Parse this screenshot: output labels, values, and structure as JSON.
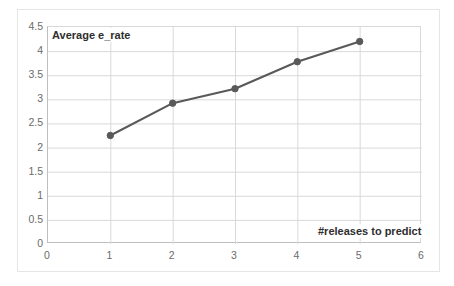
{
  "chart_data": {
    "type": "line",
    "title": "",
    "xlabel": "#releases to predict",
    "ylabel": "Average e_rate",
    "x": [
      1,
      2,
      3,
      4,
      5
    ],
    "values": [
      2.25,
      2.92,
      3.22,
      3.78,
      4.2
    ],
    "series": [
      {
        "name": "Average e_rate",
        "x": [
          1,
          2,
          3,
          4,
          5
        ],
        "values": [
          2.25,
          2.92,
          3.22,
          3.78,
          4.2
        ]
      }
    ],
    "xlim": [
      0,
      6
    ],
    "ylim": [
      0,
      4.5
    ],
    "x_ticks": [
      "0",
      "1",
      "2",
      "3",
      "4",
      "5",
      "6"
    ],
    "y_ticks": [
      "0",
      "0.5",
      "1",
      "1.5",
      "2",
      "2.5",
      "3",
      "3.5",
      "4",
      "4.5"
    ],
    "grid": "horizontal-and-vertical",
    "legend": "none",
    "legend_position": "none",
    "line_color": "#595959",
    "marker_color": "#595959",
    "marker": "circle",
    "plot_background": "#ffffff",
    "gridline_color": "#d9d9d9",
    "tick_label_color": "#6b6b6b",
    "axis_title_color": "#2e2e2e",
    "frame_color": "#e6e6e6"
  }
}
